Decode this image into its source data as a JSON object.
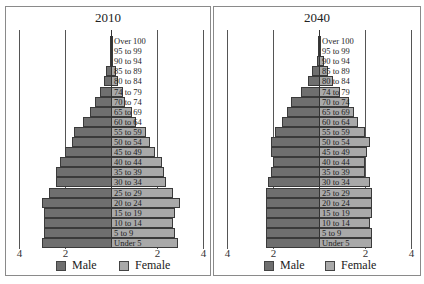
{
  "legend": {
    "male_label": "Male",
    "female_label": "Female",
    "male_color": "#6f6f6f",
    "female_color": "#a9a9a9"
  },
  "ticks": [
    "4",
    "2",
    "2",
    "4"
  ],
  "chart_data": [
    {
      "type": "bar",
      "orientation": "horizontal-pyramid",
      "title": "2010",
      "categories": [
        "Under 5",
        "5 to 9",
        "10 to 14",
        "15 to 19",
        "20 to 24",
        "25 to 29",
        "30 to 34",
        "35 to 39",
        "40 to 44",
        "45 to 49",
        "50 to 54",
        "55 to 59",
        "60 to 64",
        "65 to 69",
        "70 to 74",
        "74 to 79",
        "80 to 84",
        "85 to 89",
        "90 to 94",
        "95 to 99",
        "Over 100"
      ],
      "series": [
        {
          "name": "Male",
          "color": "#6f6f6f",
          "values": [
            3.0,
            2.9,
            2.9,
            2.9,
            3.0,
            2.7,
            2.4,
            2.4,
            2.2,
            2.0,
            1.7,
            1.6,
            1.2,
            0.9,
            0.7,
            0.5,
            0.3,
            0.2,
            0.05,
            0.02,
            0.01
          ]
        },
        {
          "name": "Female",
          "color": "#a9a9a9",
          "values": [
            2.9,
            2.8,
            2.7,
            2.8,
            3.0,
            2.7,
            2.4,
            2.3,
            2.2,
            1.9,
            1.7,
            1.5,
            1.1,
            0.9,
            0.6,
            0.5,
            0.3,
            0.2,
            0.1,
            0.04,
            0.02
          ]
        }
      ],
      "xlabel": "",
      "ylabel": "",
      "x_ticks": [
        "4",
        "2",
        "2",
        "4"
      ],
      "xlim": [
        -4,
        4
      ],
      "grid": true,
      "legend_position": "bottom"
    },
    {
      "type": "bar",
      "orientation": "horizontal-pyramid",
      "title": "2040",
      "categories": [
        "Under 5",
        "5 to 9",
        "10 to 14",
        "15 to 19",
        "20 to 24",
        "25 to 29",
        "30 to 34",
        "35 to 39",
        "40 to 44",
        "45 to 49",
        "50 to 54",
        "55 to 59",
        "60 to 64",
        "65 to 69",
        "70 to 74",
        "74 to 79",
        "80 to 84",
        "85 to 89",
        "90 to 94",
        "95 to 99",
        "Over 100"
      ],
      "series": [
        {
          "name": "Male",
          "color": "#6f6f6f",
          "values": [
            2.3,
            2.3,
            2.3,
            2.3,
            2.3,
            2.3,
            2.2,
            2.1,
            2.0,
            2.1,
            2.1,
            1.9,
            1.6,
            1.4,
            1.2,
            0.8,
            0.5,
            0.3,
            0.1,
            0.04,
            0.01
          ]
        },
        {
          "name": "Female",
          "color": "#a9a9a9",
          "values": [
            2.3,
            2.3,
            2.2,
            2.3,
            2.3,
            2.3,
            2.2,
            2.0,
            2.0,
            2.1,
            2.2,
            2.0,
            1.7,
            1.5,
            1.3,
            0.9,
            0.6,
            0.4,
            0.2,
            0.1,
            0.02
          ]
        }
      ],
      "xlabel": "",
      "ylabel": "",
      "x_ticks": [
        "4",
        "2",
        "2",
        "4"
      ],
      "xlim": [
        -4,
        4
      ],
      "grid": true,
      "legend_position": "bottom"
    }
  ]
}
